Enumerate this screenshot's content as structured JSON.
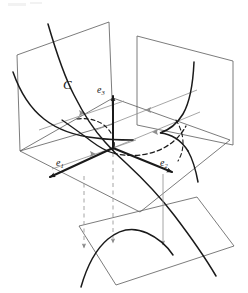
{
  "figure": {
    "kind": "3d-geometry-diagram",
    "title": "",
    "background_color": "#ffffff",
    "stroke_color": "#1a1a1a",
    "plane_stroke_color": "#555555",
    "projection_stroke_color": "#8a8a8a",
    "labels": {
      "curve": "C",
      "e1_base": "e",
      "e1_sub": "1",
      "e2_base": "e",
      "e2_sub": "2",
      "e3_base": "e",
      "e3_sub": "3"
    },
    "planes": [
      {
        "name": "left-vertical-plane",
        "points": "17,55 109,22 113,124 20,151"
      },
      {
        "name": "right-vertical-plane",
        "points": "137,36 233,61 233,145 137,125"
      },
      {
        "name": "horizontal-plane",
        "points": "113,98 230,140 140,212 20,151"
      },
      {
        "name": "bottom-plane",
        "points": "79,226 197,197 234,246 116,285"
      }
    ],
    "curves": {
      "main_curve_C": "M 48,24 C 57,55 72,92 90,118 C 100,133 110,146 118,153 C 130,163 145,175 162,190 C 182,207 205,231 218,262",
      "left_plane_projection": "M 15,74 C 22,92 32,107 45,118 C 58,129 75,137 95,140 C 112,143 122,143 132,142",
      "right_plane_projection": "M 194,62 C 193,85 189,104 181,116 C 174,127 165,133 156,134 C 166,134 176,140 184,152 C 191,163 196,180 198,198",
      "bottom_plane_projection": "M 80,287 C 86,265 95,248 107,238 C 119,228 133,226 146,232 C 157,237 166,245 172,254",
      "horizontal_dashed_projection": "M 60,118 C 75,126 92,136 105,144 C 112,148 118,151 124,153 C 136,157 150,157 162,152 C 174,147 183,138 188,128"
    },
    "dashed_arcs": [
      {
        "name": "left-dashed-arc",
        "path": "M 79,120 C 93,119 104,124 110,133 C 114,139 115,145 114,149"
      },
      {
        "name": "right-dashed-arc",
        "path": "M 177,121 C 181,128 183,135 183,141 C 183,147 181,152 178,156"
      }
    ],
    "basis_vectors": [
      {
        "name": "e1",
        "from": "113,148",
        "to": "47,178",
        "label_x": 53,
        "label_y": 160
      },
      {
        "name": "e2",
        "from": "113,148",
        "to": "177,174",
        "label_x": 163,
        "label_y": 160
      },
      {
        "name": "e3",
        "from": "113,148",
        "to": "113,92",
        "label_x": 98,
        "label_y": 88
      }
    ],
    "projection_rays": [
      {
        "name": "ray-to-left-plane-upper",
        "from": "117,104",
        "to": "44,129",
        "arrow_at": "0.52"
      },
      {
        "name": "ray-to-left-plane-lower",
        "from": "130,141",
        "to": "57,166",
        "arrow_at": "0.45"
      },
      {
        "name": "ray-to-right-plane-upper",
        "from": "113,148",
        "to": "196,113",
        "arrow_at": "0.55"
      },
      {
        "name": "ray-to-right-plane-lower",
        "from": "113,148",
        "to": "186,127",
        "arrow_at": "0.55"
      }
    ],
    "vertical_drop_lines": [
      {
        "name": "drop-line-left",
        "x": 84,
        "y1": 178,
        "y2": 248,
        "style": "dashed"
      },
      {
        "name": "drop-line-center",
        "x": 113,
        "y1": 155,
        "y2": 243,
        "style": "dashed"
      },
      {
        "name": "drop-line-right",
        "x": 163,
        "y1": 176,
        "y2": 245,
        "style": "solid"
      }
    ]
  }
}
